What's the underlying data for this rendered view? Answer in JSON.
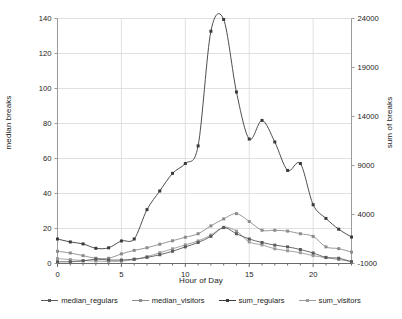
{
  "chart_data": {
    "type": "line",
    "title": "",
    "xlabel": "Hour of Day",
    "ylabel": "median breaks",
    "ylabel_right": "sum of breaks",
    "x": [
      0,
      1,
      2,
      3,
      4,
      5,
      6,
      7,
      8,
      9,
      10,
      11,
      12,
      13,
      14,
      15,
      16,
      17,
      18,
      19,
      20,
      21,
      22,
      23
    ],
    "xlim": [
      0,
      23
    ],
    "xticks": [
      0,
      5,
      10,
      15,
      20
    ],
    "xticklabels": [
      "0",
      "5",
      "10",
      "15",
      "20"
    ],
    "ylim": [
      0,
      140
    ],
    "yticks": [
      0,
      20,
      40,
      60,
      80,
      100,
      120,
      140
    ],
    "yticklabels": [
      "0",
      "20",
      "40",
      "60",
      "80",
      "100",
      "120",
      "140"
    ],
    "ylim_right": [
      -1000,
      24000
    ],
    "yticks_right": [
      -1000,
      4000,
      9000,
      14000,
      19000,
      24000
    ],
    "yticklabels_right": [
      "-1000",
      "4000",
      "9000",
      "14000",
      "19000",
      "24000"
    ],
    "grid": true,
    "legend_position": "bottom",
    "series": [
      {
        "name": "median_regulars",
        "axis": "left",
        "color": "#5a5a5a",
        "marker": "square",
        "values": [
          1,
          1,
          1.5,
          2.5,
          2,
          2,
          2.5,
          3.5,
          5,
          7,
          9.5,
          12,
          15.5,
          20.5,
          17,
          14,
          12,
          10.5,
          9.5,
          8,
          6,
          3.5,
          3,
          1
        ]
      },
      {
        "name": "median_visitors",
        "axis": "left",
        "color": "#8c8c8c",
        "marker": "square",
        "values": [
          7,
          6,
          4.5,
          3,
          3,
          5.5,
          7.5,
          9,
          11,
          13,
          15,
          17,
          21.5,
          25.5,
          28.5,
          24,
          19,
          19,
          18.5,
          17,
          15.5,
          9.5,
          8.5,
          6.5
        ]
      },
      {
        "name": "sum_regulars",
        "axis": "right",
        "color": "#3a3a3a",
        "marker": "square",
        "values": [
          1500,
          1200,
          1000,
          550,
          600,
          1300,
          1500,
          4500,
          6400,
          8200,
          9200,
          11000,
          22700,
          23900,
          16500,
          11700,
          13600,
          11400,
          8500,
          9200,
          5000,
          3600,
          2500,
          1700
        ]
      },
      {
        "name": "sum_visitors",
        "axis": "right",
        "color": "#9a9a9a",
        "marker": "square",
        "values": [
          -500,
          -600,
          -700,
          -750,
          -780,
          -760,
          -600,
          -300,
          100,
          500,
          900,
          1300,
          1900,
          2700,
          2300,
          1200,
          900,
          500,
          300,
          100,
          -200,
          -400,
          -600,
          -800
        ]
      }
    ]
  },
  "chart": {
    "frame_color": "#b4b4b4",
    "grid_color": "#d8d8d8",
    "background": "#ffffff"
  }
}
